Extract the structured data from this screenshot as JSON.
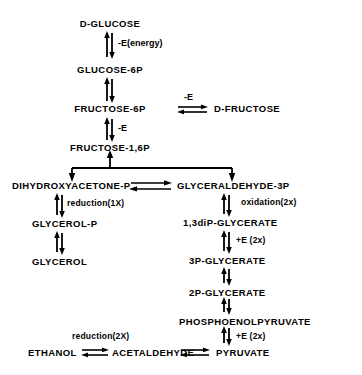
{
  "diagram": {
    "nodes": {
      "d_glucose": "D-GLUCOSE",
      "glucose_6p": "GLUCOSE-6P",
      "fructose_6p": "FRUCTOSE-6P",
      "d_fructose": "D-FRUCTOSE",
      "fructose_16p": "FRUCTOSE-1,6P",
      "dhap": "DIHYDROXYACETONE-P",
      "g3p": "GLYCERALDEHYDE-3P",
      "glycerol_p": "GLYCEROL-P",
      "glycerol": "GLYCEROL",
      "bpg": "1,3diP-GLYCERATE",
      "pg3": "3P-GLYCERATE",
      "pg2": "2P-GLYCERATE",
      "pep": "PHOSPHOENOLPYRUVATE",
      "pyruvate": "PYRUVATE",
      "acetaldehyde": "ACETALDEHYDE",
      "ethanol": "ETHANOL"
    },
    "edge_labels": {
      "e_energy": "-E(energy)",
      "e_minus_fructose": "-E",
      "e_minus_f16p": "-E",
      "reduction_1x": "reduction(1X)",
      "oxidation_2x": "oxidation(2x)",
      "plus_e_2x_bpg": "+E (2x)",
      "plus_e_2x_pep": "+E (2x)",
      "reduction_2x": "reduction(2X)"
    }
  }
}
